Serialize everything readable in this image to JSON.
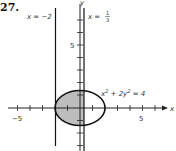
{
  "problem_number": "27.",
  "axes": {
    "x_label": "x",
    "y_label": "y",
    "x_ticks": [
      -5,
      -4,
      -3,
      -2,
      -1,
      1,
      2,
      3,
      4,
      5,
      6
    ],
    "y_ticks": [
      -3,
      -2,
      -1,
      1,
      2,
      3,
      4,
      5,
      6
    ],
    "x_tick_labels": {
      "neg": "−5",
      "pos": "5"
    },
    "y_tick_label": "5"
  },
  "lines": {
    "left": {
      "label": "x = −2",
      "value": -2
    },
    "right": {
      "label_prefix": "x = ",
      "num": "1",
      "den": "3",
      "value": 0.3333
    }
  },
  "curve": {
    "equation": "x² + 2y² = 4",
    "eq_x": "x",
    "eq_sup1": "2",
    "eq_mid": " + 2y",
    "eq_sup2": "2",
    "eq_end": " = 4",
    "semi_axis_x": 2,
    "semi_axis_y": 1.414
  },
  "shading": {
    "region": "inside ellipse between x = −2 and x = 1/3",
    "color": "#bdbdbd"
  }
}
